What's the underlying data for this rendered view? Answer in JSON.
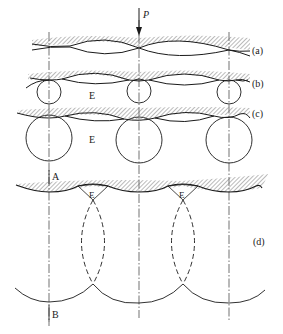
{
  "figure": {
    "force_label": "P",
    "stages": [
      {
        "id": "a",
        "label": "(a)"
      },
      {
        "id": "b",
        "label": "(b)",
        "gap_label": "E"
      },
      {
        "id": "c",
        "label": "(c)",
        "gap_label": "E"
      },
      {
        "id": "d",
        "label": "(d)",
        "gap_labels": [
          "E",
          "E"
        ],
        "axis_top_label": "A",
        "axis_bottom_label": "B"
      }
    ],
    "colors": {
      "line": "#1a1a1a",
      "hatch": "#555555",
      "background": "#ffffff"
    }
  }
}
